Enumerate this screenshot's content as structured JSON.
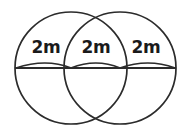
{
  "figure": {
    "type": "geometry-diagram",
    "background_color": "#ffffff",
    "stroke_color": "#2b2b2b",
    "text_color": "#1a1a1a",
    "canvas": {
      "width": 191,
      "height": 136
    },
    "labels": [
      {
        "id": "left",
        "text": "2m",
        "x": 46,
        "y": 48
      },
      {
        "id": "middle",
        "text": "2m",
        "x": 96,
        "y": 48
      },
      {
        "id": "right",
        "text": "2m",
        "x": 146,
        "y": 48
      }
    ],
    "circles": [
      {
        "id": "left-circle",
        "cx": 71,
        "cy": 68,
        "r": 56
      },
      {
        "id": "right-circle",
        "cx": 120,
        "cy": 68,
        "r": 56
      }
    ],
    "chord": {
      "id": "horizontal-chord",
      "x1": 15,
      "y1": 68,
      "x2": 176,
      "y2": 68
    },
    "arcs": [
      {
        "id": "arc-left",
        "d": "M 16 68 Q 46 58 71 68"
      },
      {
        "id": "arc-middle",
        "d": "M 71 68 Q 96 58 120 68"
      },
      {
        "id": "arc-right",
        "d": "M 120 68 Q 148 58 175 68"
      }
    ]
  }
}
